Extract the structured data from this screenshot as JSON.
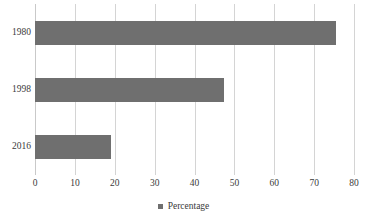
{
  "chart_data": {
    "type": "bar",
    "orientation": "horizontal",
    "title": "",
    "xlabel": "",
    "ylabel": "",
    "categories": [
      "1980",
      "1998",
      "2016"
    ],
    "series": [
      {
        "name": "Percentage",
        "values": [
          75.5,
          47.5,
          19
        ],
        "color": "#6f6f6f"
      }
    ],
    "xlim": [
      0,
      80
    ],
    "xticks": [
      0,
      10,
      20,
      30,
      40,
      50,
      60,
      70,
      80
    ],
    "xtick_labels": [
      "0",
      "10",
      "20",
      "30",
      "40",
      "50",
      "60",
      "70",
      "80"
    ],
    "grid": "vertical",
    "gridline_color": "#d4d4d4",
    "legend": {
      "position": "bottom-center",
      "entries": [
        {
          "label": "Percentage",
          "color": "#6f6f6f",
          "marker": "square"
        }
      ]
    },
    "background_color": "#ffffff",
    "text_color": "#3a3a3a"
  }
}
